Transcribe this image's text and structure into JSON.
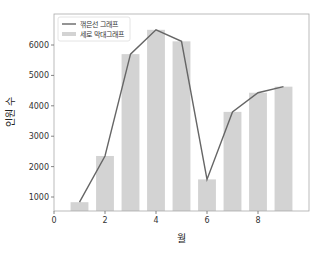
{
  "chart_data": {
    "type": "bar",
    "title": "",
    "xlabel": "월",
    "ylabel": "인원 수",
    "xlim": [
      0,
      10
    ],
    "ylim": [
      540,
      7020
    ],
    "xticks": [
      0,
      2,
      4,
      6,
      8
    ],
    "yticks": [
      1000,
      2000,
      3000,
      4000,
      5000,
      6000
    ],
    "grid": false,
    "legend_position": "upper left",
    "x": [
      1,
      2,
      3,
      4,
      5,
      6,
      7,
      8,
      9
    ],
    "series": [
      {
        "name": "꺾은선 그래프",
        "type": "line",
        "color": "#666666",
        "values": [
          830,
          2350,
          5700,
          6500,
          6120,
          1580,
          3800,
          4430,
          4630
        ]
      },
      {
        "name": "세로 막대그래프",
        "type": "bar",
        "color": "#d3d3d3",
        "values": [
          830,
          2350,
          5700,
          6500,
          6120,
          1580,
          3800,
          4430,
          4630
        ]
      }
    ]
  }
}
